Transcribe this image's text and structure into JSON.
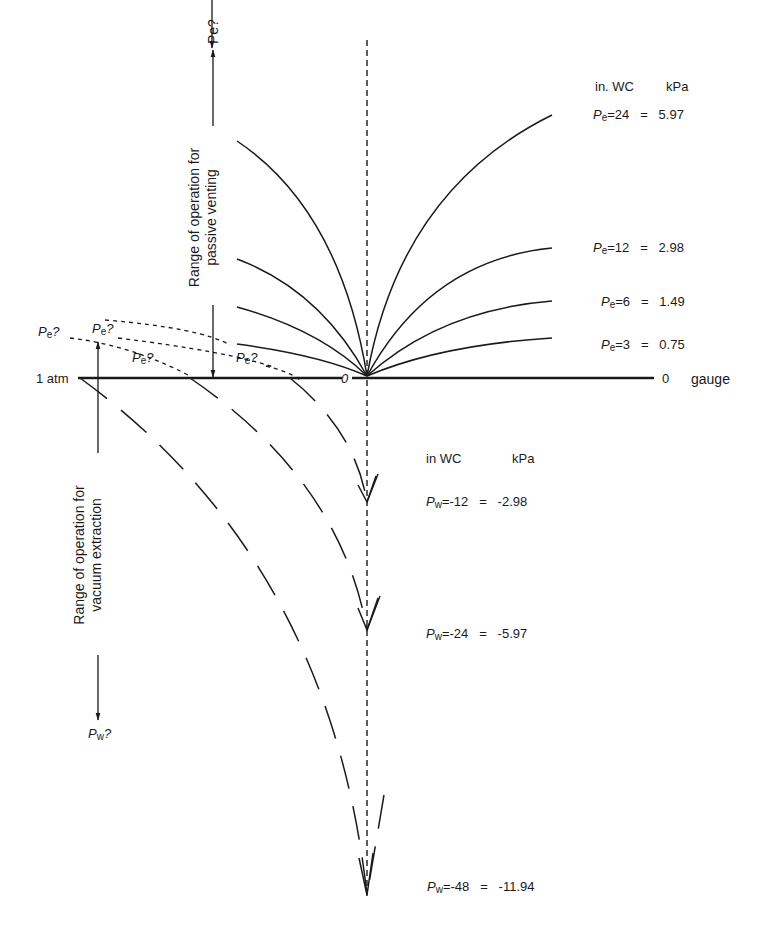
{
  "diagram": {
    "baseline": {
      "left_label": "1 atm",
      "center_label": "0",
      "right_label_value": "0",
      "right_label_unit": "gauge"
    },
    "passive": {
      "header": {
        "col1": "in. WC",
        "col2": "kPa"
      },
      "axis_label": "Pe?",
      "range_label_line1": "Range of operation for",
      "range_label_line2": "passive venting",
      "curves": [
        {
          "sym": "P",
          "sub": "e",
          "inwc": "=24",
          "eq": "=",
          "kpa": "5.97"
        },
        {
          "sym": "P",
          "sub": "e",
          "inwc": "=12",
          "eq": "=",
          "kpa": "2.98"
        },
        {
          "sym": "P",
          "sub": "e",
          "inwc": "=6",
          "eq": "=",
          "kpa": "1.49"
        },
        {
          "sym": "P",
          "sub": "e",
          "inwc": "=3",
          "eq": "=",
          "kpa": "0.75"
        }
      ],
      "unknown_labels": [
        "Pe?",
        "Pe?",
        "Pe?",
        "Pe?"
      ]
    },
    "vacuum": {
      "header": {
        "col1": "in WC",
        "col2": "kPa"
      },
      "axis_label": "Pw?",
      "range_label_line1": "Range of operation for",
      "range_label_line2": "vacuum extraction",
      "curves": [
        {
          "sym": "P",
          "sub": "w",
          "inwc": "=-12",
          "eq": "=",
          "kpa": "-2.98"
        },
        {
          "sym": "P",
          "sub": "w",
          "inwc": "=-24",
          "eq": "=",
          "kpa": "-5.97"
        },
        {
          "sym": "P",
          "sub": "w",
          "inwc": "=-48",
          "eq": "=",
          "kpa": "-11.94"
        }
      ]
    },
    "colors": {
      "ink": "#1a1a1a",
      "background": "#ffffff"
    }
  }
}
